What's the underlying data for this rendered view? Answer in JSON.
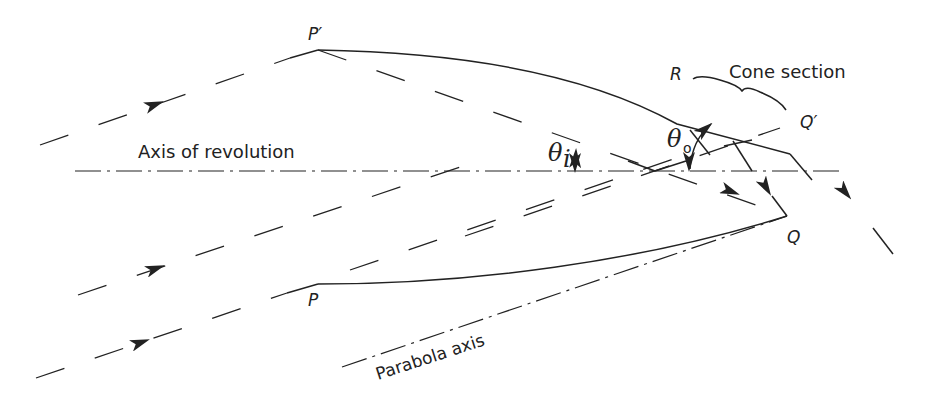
{
  "figure": {
    "type": "optical ray diagram"
  },
  "labels": {
    "axis_of_revolution": "Axis of revolution",
    "parabola_axis": "Parabola axis",
    "cone_section": "Cone section",
    "point_p_prime": "P′",
    "point_p": "P",
    "point_r": "R",
    "point_q_prime": "Q′",
    "point_q": "Q",
    "theta_i": "θ",
    "theta_i_sub": "i",
    "theta_o": "θ",
    "theta_o_sub": "o"
  },
  "colors": {
    "ink": "#222222",
    "background": "#ffffff"
  },
  "elements": {
    "incident_rays": 5,
    "reflected_rays": 4,
    "reflector_profiles": [
      "P′–R–Q′ (upper)",
      "P–Q (lower)"
    ],
    "angles": [
      "θi (acceptance half-angle)",
      "θo (exit angle)"
    ]
  }
}
